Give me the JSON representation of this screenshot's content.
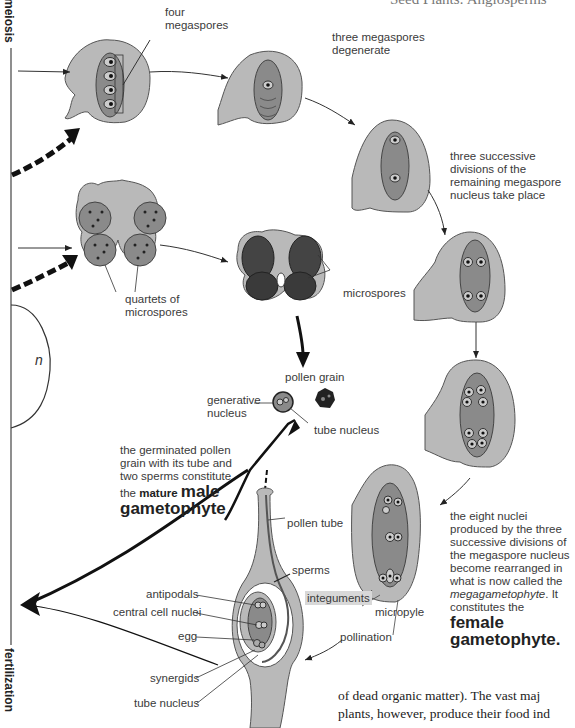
{
  "header": {
    "running_title": "Seed Plants: Angiosperms"
  },
  "axis": {
    "top_label": "meiosis",
    "bottom_label": "fertilization",
    "ploidy_label": "n"
  },
  "labels": {
    "four_megaspores": "four megaspores",
    "three_megaspores_degenerate": "three megaspores degenerate",
    "three_successive_divisions": "three successive divisions of the remaining megaspore nucleus take place",
    "quartets_of_microspores": "quartets of microspores",
    "microspores": "microspores",
    "pollen_grain": "pollen grain",
    "generative_nucleus": "generative nucleus",
    "tube_nucleus_pollen": "tube nucleus",
    "male_caption_plain": "the germinated pollen grain with its tube and two sperms constitute the",
    "male_caption_mature": "mature",
    "male_caption_bold": "male gametophyte",
    "pollen_tube": "pollen tube",
    "sperms": "sperms",
    "antipodals": "antipodals",
    "central_cell_nuclei": "central cell nuclei",
    "egg": "egg",
    "synergids": "synergids",
    "tube_nucleus_ovule": "tube nucleus",
    "integuments": "integuments",
    "micropyle": "micropyle",
    "pollination": "pollination",
    "female_caption_plain": "the eight nuclei produced by the three successive divisions of the megaspore nucleus become rearranged in what is now called the",
    "female_caption_italic": "megagametophyte",
    "female_caption_after_italic": ". It constitutes the",
    "female_caption_bold": "female gametophyte."
  },
  "body_text": {
    "line1": "of dead organic matter). The vast maj",
    "line2": "plants, however, produce their food ind"
  },
  "colors": {
    "ovule_light": "#b9b9b9",
    "ovule_dark": "#8a8a8a",
    "nucleus": "#1a1a1a",
    "arrow": "#1a1a1a",
    "integument_highlight": "#d8d8d8"
  }
}
